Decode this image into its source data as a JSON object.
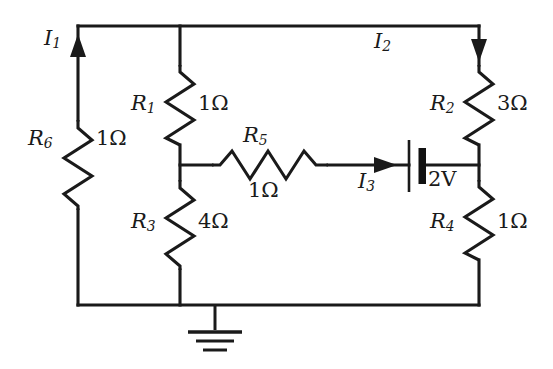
{
  "diagram": {
    "ink_color": "#1a1a1a",
    "background_color": "#ffffff",
    "ground_node_label": "ground"
  },
  "components": {
    "r1": {
      "name": "R",
      "sub": "1",
      "value": "1Ω"
    },
    "r2": {
      "name": "R",
      "sub": "2",
      "value": "3Ω"
    },
    "r3": {
      "name": "R",
      "sub": "3",
      "value": "4Ω"
    },
    "r4": {
      "name": "R",
      "sub": "4",
      "value": "1Ω"
    },
    "r5": {
      "name": "R",
      "sub": "5",
      "value": "1Ω"
    },
    "r6": {
      "name": "R",
      "sub": "6",
      "value": "1Ω"
    },
    "battery": {
      "value": "2V"
    }
  },
  "currents": {
    "i1": {
      "name": "I",
      "sub": "1",
      "direction": "up"
    },
    "i2": {
      "name": "I",
      "sub": "2",
      "direction": "down"
    },
    "i3": {
      "name": "I",
      "sub": "3",
      "direction": "right"
    }
  }
}
